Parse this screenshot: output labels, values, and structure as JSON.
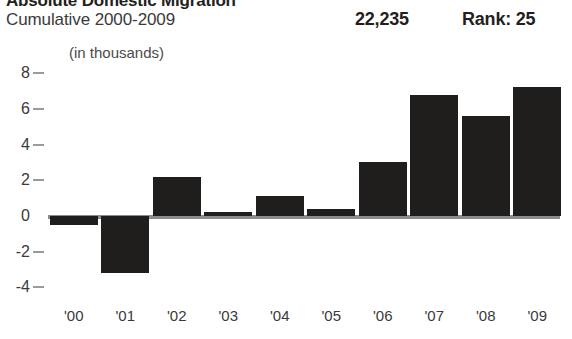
{
  "header": {
    "title": "Absolute Domestic Migration",
    "subtitle": "Cumulative 2000-2009",
    "stat_value": "22,235",
    "rank": "Rank: 25"
  },
  "axis": {
    "units_label": "(in thousands)"
  },
  "chart_data": {
    "type": "bar",
    "title": "Absolute Domestic Migration",
    "subtitle": "Cumulative 2000-2009",
    "xlabel": "",
    "ylabel": "(in thousands)",
    "categories": [
      "'00",
      "'01",
      "'02",
      "'03",
      "'04",
      "'05",
      "'06",
      "'07",
      "'08",
      "'09"
    ],
    "values": [
      -0.5,
      -3.2,
      2.2,
      0.2,
      1.1,
      0.4,
      3.0,
      6.8,
      5.6,
      7.25
    ],
    "ylim": [
      -4,
      8
    ],
    "yticks": [
      8,
      6,
      4,
      2,
      0,
      -2,
      -4
    ],
    "ytick_labels": [
      "8",
      "6",
      "4",
      "2",
      "0",
      "-2",
      "-4"
    ],
    "grid": false,
    "legend": false,
    "bar_color": "#201d1d",
    "baseline_color": "#8c8c8c",
    "annotations": {
      "cumulative_total": "22,235",
      "rank": "Rank: 25"
    }
  },
  "geometry": {
    "baseline_y": 216,
    "px_per_unit": 17.85,
    "plot_left": 48,
    "plot_right": 560,
    "bar_width": 48,
    "bar_step": 51.5,
    "ytick_mark_x": 33,
    "ylabel_x": 4,
    "xlabel_y": 308
  }
}
